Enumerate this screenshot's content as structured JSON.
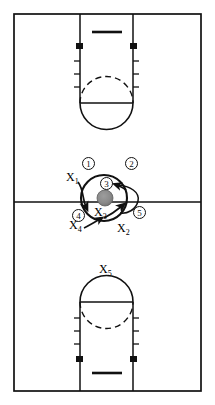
{
  "diagram": {
    "type": "basketball-play-diagram",
    "orientation": "vertical-full-court",
    "colors": {
      "line": "#111111",
      "court_fill": "#ffffff",
      "ball_fill": "#8a8a8a",
      "border": "#000000"
    }
  },
  "court": {
    "border": {
      "x": 14,
      "y": 14,
      "width": 187,
      "height": 377
    },
    "midcourt_line_y": 202,
    "keys": [
      {
        "name": "top-key",
        "baseline_y": 14,
        "lane_left_x": 80,
        "lane_right_x": 133,
        "free_throw_line_y": 103,
        "backboard_y": 32,
        "rim_y": 46
      },
      {
        "name": "bottom-key",
        "baseline_y": 391,
        "lane_left_x": 80,
        "lane_right_x": 133,
        "free_throw_line_y": 302,
        "backboard_y": 373,
        "rim_y": 359
      }
    ]
  },
  "ball": {
    "label": "ball",
    "x": 105,
    "y": 198,
    "radius": 8
  },
  "huddle_circle": {
    "cx": 104,
    "cy": 198,
    "r": 23
  },
  "offense": [
    {
      "id": "1",
      "label": "①",
      "name": "player-1",
      "x": 88,
      "y": 163
    },
    {
      "id": "2",
      "label": "②",
      "name": "player-2",
      "x": 131,
      "y": 163
    },
    {
      "id": "3",
      "label": "③",
      "name": "player-3",
      "x": 106,
      "y": 183
    },
    {
      "id": "4",
      "label": "④",
      "name": "player-4",
      "x": 78,
      "y": 215
    },
    {
      "id": "5",
      "label": "⑤",
      "name": "player-5",
      "x": 139,
      "y": 212
    }
  ],
  "defense": [
    {
      "id": "X1",
      "label": "X",
      "sub": "1",
      "name": "defender-x1",
      "x": 68,
      "y": 175
    },
    {
      "id": "X2",
      "label": "X",
      "sub": "2",
      "name": "defender-x2",
      "x": 121,
      "y": 227
    },
    {
      "id": "X3",
      "label": "X",
      "sub": "3",
      "name": "defender-x3",
      "x": 98,
      "y": 211
    },
    {
      "id": "X4",
      "label": "X",
      "sub": "4",
      "name": "defender-x4",
      "x": 73,
      "y": 224
    },
    {
      "id": "X5",
      "label": "X",
      "sub": "5",
      "name": "defender-x5",
      "x": 99,
      "y": 268
    }
  ],
  "movement_arrows": [
    {
      "name": "arrow-x1-cut",
      "from": "X1",
      "to": "ball-left",
      "style": "curved"
    },
    {
      "name": "arrow-x3-cut",
      "from": "X3",
      "to": "ball-lower-right",
      "style": "curved"
    },
    {
      "name": "arrow-3-loop",
      "from": "player-3",
      "to": "right-wing",
      "style": "curved-loop"
    },
    {
      "name": "arrow-x4-cut",
      "from": "X4",
      "to": "X3",
      "style": "straight"
    }
  ]
}
